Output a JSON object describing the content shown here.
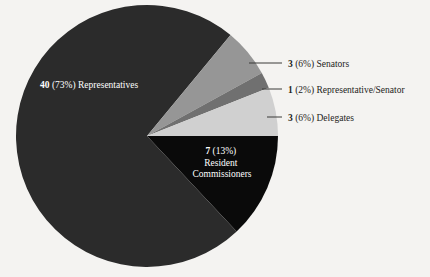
{
  "chart_data": {
    "type": "pie",
    "title": "",
    "subtitle": "",
    "xlabel": "",
    "ylabel": "",
    "legend_position": "none",
    "grid": false,
    "total": 54,
    "start_angle_deg": 0,
    "direction": "clockwise",
    "categories": [
      "Resident Commissioners",
      "Representatives",
      "Senators",
      "Representative/Senator",
      "Delegates"
    ],
    "values": [
      7,
      40,
      3,
      1,
      3
    ],
    "percents": [
      13,
      73,
      6,
      2,
      6
    ],
    "colors": [
      "#0a0a0a",
      "#2b2b2b",
      "#969696",
      "#707070",
      "#d0d0d0"
    ],
    "slices": [
      {
        "name": "Resident Commissioners",
        "value": 7,
        "percent": 13,
        "color": "#0a0a0a",
        "label_value": "7",
        "label_percent": "(13%)",
        "label_name_line1": "Resident",
        "label_name_line2": "Commissioners",
        "label_placement": "inside",
        "label_color": "#ffffff"
      },
      {
        "name": "Representatives",
        "value": 40,
        "percent": 73,
        "color": "#2b2b2b",
        "label_value": "40",
        "label_percent": "(73%)",
        "label_name": "Representatives",
        "label_placement": "inside",
        "label_color": "#ffffff"
      },
      {
        "name": "Senators",
        "value": 3,
        "percent": 6,
        "color": "#969696",
        "label_value": "3",
        "label_percent": "(6%)",
        "label_name": "Senators",
        "label_placement": "callout",
        "label_color": "#1d1d1b"
      },
      {
        "name": "Representative/Senator",
        "value": 1,
        "percent": 2,
        "color": "#707070",
        "label_value": "1",
        "label_percent": "(2%)",
        "label_name": "Representative/Senator",
        "label_placement": "callout",
        "label_color": "#1d1d1b"
      },
      {
        "name": "Delegates",
        "value": 3,
        "percent": 6,
        "color": "#d0d0d0",
        "label_value": "3",
        "label_percent": "(6%)",
        "label_name": "Delegates",
        "label_placement": "callout",
        "label_color": "#1d1d1b"
      }
    ],
    "background_color": "#f4f3f1",
    "leader_line_color": "#3a3a38"
  }
}
